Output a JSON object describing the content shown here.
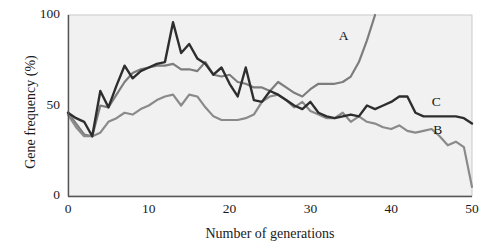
{
  "chart_data": {
    "type": "line",
    "title": "",
    "subtitle": "",
    "xlabel": "Number of generations",
    "ylabel": "Gene frequency (%)",
    "xlim": [
      0,
      50
    ],
    "ylim": [
      0,
      100
    ],
    "xticks": [
      "0",
      "10",
      "20",
      "30",
      "40",
      "50"
    ],
    "xtick_values": [
      0,
      10,
      20,
      30,
      40,
      50
    ],
    "yticks": [
      "0",
      "50",
      "100"
    ],
    "ytick_values": [
      0,
      50,
      100
    ],
    "grid": false,
    "legend_position": "inline-end-labels",
    "annotations": [
      {
        "text": "A",
        "x": 34.0,
        "y": 88.0
      },
      {
        "text": "C",
        "x": 45.5,
        "y": 51.5
      },
      {
        "text": "B",
        "x": 45.7,
        "y": 36.0
      }
    ],
    "colors": {
      "series_A": "#7d7d7d",
      "series_B": "#8a8a8a",
      "series_C": "#2e2e2e",
      "plot_background": "#f1f1f1",
      "axis": "#555555",
      "text": "#1a1a1a"
    },
    "x": [
      0,
      1,
      2,
      3,
      4,
      5,
      6,
      7,
      8,
      9,
      10,
      11,
      12,
      13,
      14,
      15,
      16,
      17,
      18,
      19,
      20,
      21,
      22,
      23,
      24,
      25,
      26,
      27,
      28,
      29,
      30,
      31,
      32,
      33,
      34,
      35,
      36,
      37,
      38,
      39,
      40,
      41,
      42,
      43,
      44,
      45,
      46,
      47,
      48,
      49,
      50
    ],
    "series": [
      {
        "name": "A",
        "label": "A",
        "color": "#7d7d7d",
        "values": [
          46,
          40,
          34,
          33,
          50,
          49,
          56,
          63,
          68,
          70,
          71,
          72,
          72,
          73,
          70,
          70,
          69,
          74,
          67,
          66,
          67,
          63,
          62,
          60,
          60,
          58,
          63,
          60,
          57,
          55,
          59,
          62,
          62,
          62,
          63,
          66,
          74,
          86,
          100,
          null,
          null,
          null,
          null,
          null,
          null,
          null,
          null,
          null,
          null,
          null,
          null
        ]
      },
      {
        "name": "B",
        "label": "B",
        "color": "#8a8a8a",
        "values": [
          45,
          38,
          33,
          33,
          35,
          41,
          43,
          46,
          45,
          48,
          50,
          53,
          55,
          56,
          50,
          56,
          55,
          49,
          44,
          42,
          42,
          42,
          43,
          45,
          52,
          55,
          56,
          53,
          49,
          52,
          47,
          45,
          43,
          43,
          46,
          41,
          44,
          41,
          40,
          38,
          37,
          39,
          36,
          35,
          36,
          37,
          33,
          28,
          30,
          27,
          5
        ]
      },
      {
        "name": "C",
        "label": "C",
        "color": "#2e2e2e",
        "values": [
          46,
          43,
          41,
          33,
          58,
          49,
          61,
          72,
          65,
          69,
          71,
          73,
          74,
          96,
          79,
          84,
          76,
          73,
          67,
          71,
          62,
          55,
          71,
          53,
          52,
          58,
          56,
          53,
          50,
          48,
          52,
          46,
          44,
          43,
          44,
          45,
          44,
          50,
          48,
          50,
          52,
          55,
          55,
          46,
          44,
          44,
          44,
          44,
          44,
          43,
          40
        ]
      }
    ]
  }
}
